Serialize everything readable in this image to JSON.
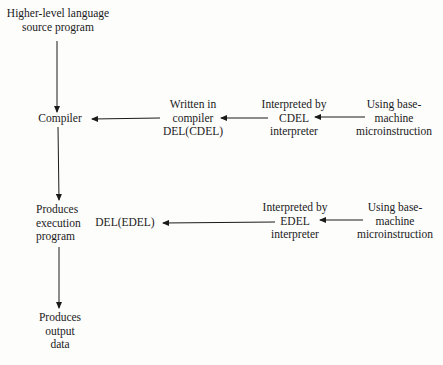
{
  "diagram": {
    "nodes": {
      "source": {
        "lines": [
          "Higher-level language",
          "source program"
        ]
      },
      "compiler": {
        "lines": [
          "Compiler"
        ]
      },
      "written_in": {
        "lines": [
          "Written in",
          "compiler",
          "DEL(CDEL)"
        ]
      },
      "cdel_interp": {
        "lines": [
          "Interpreted by",
          "CDEL",
          "interpreter"
        ]
      },
      "base1": {
        "lines": [
          "Using base-",
          "machine",
          "microinstruction"
        ]
      },
      "produces_exec": {
        "lines": [
          "Produces",
          "execution",
          "program"
        ],
        "label_inline": "DEL(EDEL)"
      },
      "edel_interp": {
        "lines": [
          "Interpreted by",
          "EDEL",
          "interpreter"
        ]
      },
      "base2": {
        "lines": [
          "Using base-",
          "machine",
          "microinstruction"
        ]
      },
      "output": {
        "lines": [
          "Produces",
          "output",
          "data"
        ]
      }
    },
    "edges": [
      {
        "from": "source",
        "to": "compiler"
      },
      {
        "from": "written_in",
        "to": "compiler"
      },
      {
        "from": "cdel_interp",
        "to": "written_in"
      },
      {
        "from": "base1",
        "to": "cdel_interp"
      },
      {
        "from": "compiler",
        "to": "produces_exec"
      },
      {
        "from": "edel_interp",
        "to": "produces_exec"
      },
      {
        "from": "base2",
        "to": "edel_interp"
      },
      {
        "from": "produces_exec",
        "to": "output"
      }
    ]
  }
}
